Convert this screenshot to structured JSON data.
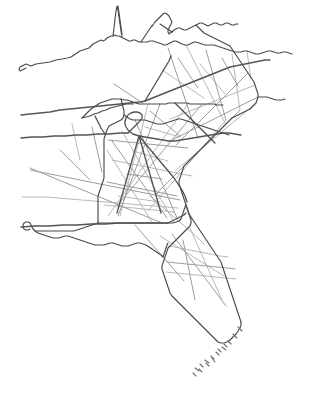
{
  "document": {
    "title": "Southeastern United States Map",
    "description": "Hand-drawn outline map of the southeastern United States showing state boundaries and a network of highways",
    "style": "hand-drawn sketch",
    "background_color": "#ffffff"
  },
  "palette": {
    "background": "#ffffff",
    "state_border": "#4a4a4a",
    "state_border_thin": "#5c5c5c",
    "interstate_major": "#555555",
    "road": "#9d9d9d",
    "road_faint": "#b0b0b0",
    "island": "#6e6e6e"
  },
  "canvas": {
    "width": 310,
    "height": 408
  },
  "map_content": {
    "regions": [
      "Kentucky",
      "West Virginia",
      "Virginia",
      "Tennessee",
      "North Carolina",
      "South Carolina",
      "Georgia",
      "Alabama",
      "Mississippi",
      "Louisiana",
      "Florida",
      "Florida Keys"
    ],
    "feature_types": [
      "state-boundary",
      "interstate-highway",
      "secondary-road",
      "coastline",
      "island-chain"
    ]
  },
  "geometry": {
    "state_borders": [
      "M 22 66 L 26 64 L 31 66 L 36 64 L 43 63 L 50 62 L 56 60 L 62 59 L 67 58 L 71 57 L 74 55 L 77 53 L 80 51 L 83 50 L 86 49 L 89 48 L 91 46 L 93 44 L 95 43 L 97 42 L 99 41 L 101 40 L 103 41 L 105 40 L 107 38 L 109 37 L 111 36 L 113 36 L 115 35 L 117 36 L 119 36 L 121 37 L 123 38 L 125 39 L 127 40 L 129 41 L 131 41 L 133 40 L 135 40 L 137 41 L 139 42 L 141 42 L 144 42 L 147 42 L 150 41 L 153 41 L 156 42 L 159 43 L 162 44 L 164 45 L 166 45 L 168 44 L 170 43 L 172 42 L 174 41 L 176 41 L 178 42 L 180 43 L 182 44 L 185 45 L 188 45 L 190 44 L 192 43 L 194 42 L 196 42 L 199 43 L 202 44 L 205 45 L 208 45 L 211 45 L 214 45 L 217 46 L 220 47 L 223 48 L 226 49 L 229 50 L 232 51 L 235 52 L 238 52 L 241 52 L 244 51 L 247 51 L 250 52 L 253 53 L 256 54 L 259 54 L 262 53 L 265 52 L 268 51 L 271 51 L 274 52 L 277 53 L 280 53 L 283 52 L 286 52 L 289 53 L 292 54",
      "M 113 36 L 114 28 L 115 19 L 116 11 L 117 6 L 118 10 L 119 17 L 120 24 L 121 31 L 122 37",
      "M 141 42 L 143 39 L 145 36 L 147 33 L 149 30 L 151 27 L 153 25 L 155 22 L 157 20 L 159 18 L 161 16 L 163 14 L 165 13 L 167 14 L 169 16 L 170 18 L 171 20 L 172 22 L 171 24 L 170 26 L 169 28 L 168 30 L 168 32 L 169 34 L 170 33 L 172 32 L 174 30 L 176 29 L 178 28 L 180 28 L 182 29 L 184 30 L 186 30 L 188 29 L 190 28 L 192 27 L 194 26 L 196 25 L 198 24 L 200 23 L 202 23 L 204 24 L 206 25 L 208 26 L 210 25 L 212 24 L 214 23 L 216 23 L 218 24 L 220 25 L 222 25 L 224 24 L 226 23 L 228 23 L 230 24 L 232 25 L 234 25 L 236 24 L 238 24",
      "M 160 24 L 163 26 L 166 28 L 169 30 L 172 32",
      "M 196 25 L 198 27 L 200 29 L 202 31 L 204 33 L 206 34 L 208 35 L 210 36 L 212 37 L 214 38 L 216 39 L 218 40 L 220 41 L 222 42 L 224 43 L 226 44 L 228 45 L 230 46",
      "M 118 6 L 119 13 L 120 20 L 121 27 L 122 34",
      "M 22 66 L 20 67 L 19 69 L 20 71 L 22 70 L 24 69 L 26 68",
      "M 82 118 L 85 115 L 88 112 L 91 109 L 94 107 L 97 105 L 100 103 L 103 102 L 106 101 L 109 100 L 112 99 L 115 99 L 118 99 L 121 99 L 124 100 L 127 100 L 130 101 L 133 102 L 136 103 L 139 104 L 142 104 L 145 104 L 148 104 L 151 104 L 154 104 L 157 104 L 160 104 L 163 104 L 166 104 L 169 103 L 172 103 L 175 103 L 178 103 L 181 103 L 184 103 L 187 103 L 190 104 L 193 104 L 196 104 L 199 104 L 202 104 L 205 104 L 208 104 L 211 104 L 214 104 L 217 105 L 220 105 L 223 105",
      "M 82 118 L 86 117 L 90 116 L 94 114 L 98 113 L 102 111 L 106 110 L 110 108 L 114 107 L 118 106 L 122 105 L 126 104 L 130 104 L 133 104",
      "M 230 46 L 232 49 L 234 52 L 236 55 L 238 58 L 240 61 L 242 64 L 244 67 L 246 70 L 248 73 L 250 76 L 252 79 L 254 82 L 255 85 L 256 88 L 257 91 L 258 94 L 258 97 L 257 100 L 256 103 L 254 105 L 252 107 L 250 109 L 248 110 L 246 111 L 244 112 L 242 113 L 240 114 L 238 115 L 236 116 L 234 117 L 232 118",
      "M 258 97 L 261 97 L 264 97 L 267 97 L 270 98 L 273 99 L 276 100 L 279 100 L 282 100 L 285 99",
      "M 232 118 L 230 120 L 228 122 L 226 124 L 224 126 L 222 128 L 220 130 L 218 132 L 216 134 L 214 136 L 212 138 L 210 140 L 208 142 L 206 144 L 204 146 L 202 148 L 200 150 L 198 152 L 196 154 L 194 156 L 192 158 L 190 160 L 188 162 L 186 164 L 184 166 L 183 169 L 182 172 L 181 175 L 180 178 L 179 181 L 179 184 L 180 187 L 181 190 L 182 193 L 183 196 L 184 199 L 185 202 L 186 205 L 187 208 L 188 211 L 189 214",
      "M 121 99 L 122 103 L 123 107 L 124 111 L 124 115 L 123 118 L 121 120 L 119 121 L 117 122 L 115 123 L 113 124 L 111 125 L 109 126 L 108 128 L 107 130 L 106 133 L 105 136 L 104 139 L 104 142 L 104 145 L 104 148 L 104 151 L 104 154 L 104 157 L 104 160 L 104 163 L 104 166 L 104 169 L 104 172 L 104 175 L 104 178 L 103 181 L 102 184 L 101 187 L 100 190 L 99 193 L 98 196 L 98 199 L 98 202 L 98 205 L 98 208 L 98 211 L 98 214 L 98 217 L 98 220 L 98 223",
      "M 124 115 L 127 117 L 130 119 L 133 120 L 136 120 L 139 120 L 142 120 L 145 120 L 148 121 L 151 122 L 154 123 L 157 124 L 160 124 L 163 124 L 166 123 L 169 122 L 172 121 L 175 120 L 178 119 L 181 119 L 184 120 L 187 121 L 190 122 L 193 123 L 196 124 L 199 125 L 202 126 L 205 127 L 208 128 L 211 129 L 214 130 L 217 131 L 220 132 L 223 133 L 226 134 L 229 135",
      "M 98 223 L 101 223 L 104 223 L 107 223 L 110 223 L 113 223 L 116 223 L 119 223 L 122 223 L 125 223 L 128 223 L 131 223 L 134 223 L 137 223 L 140 223 L 143 223 L 146 223 L 149 223 L 152 223 L 155 223 L 158 223 L 161 223 L 164 223 L 167 223 L 170 223 L 173 223 L 176 222 L 179 221 L 181 219 L 182 216 L 183 213 L 184 210 L 185 207 L 186 205",
      "M 189 214 L 191 217 L 193 220 L 195 223 L 197 226 L 199 229 L 201 232 L 203 235 L 205 238 L 207 241 L 209 244 L 211 247 L 213 250 L 215 253 L 217 256 L 219 259 L 221 262 L 222 265 L 223 268 L 224 271 L 225 274 L 226 277 L 227 280 L 228 283 L 229 286 L 230 289 L 231 292 L 232 295 L 233 298 L 234 301 L 235 304 L 236 307 L 237 310 L 238 313 L 239 316 L 240 319 L 241 322",
      "M 186 205 L 187 208 L 188 211 L 189 214 L 190 217 L 191 220 L 191 223 L 190 226 L 188 228 L 186 230 L 184 232 L 182 234 L 180 236 L 178 238 L 176 240 L 174 242 L 172 244 L 170 246 L 168 248 L 167 251 L 166 254 L 165 257 L 164 260 L 163 263 L 162 266 L 162 269 L 163 272 L 164 275 L 165 278 L 166 281 L 167 284 L 168 287 L 169 290 L 170 293 L 172 296 L 174 298 L 176 300 L 178 302 L 180 304 L 182 306 L 184 308 L 186 310 L 188 312 L 190 314 L 192 316 L 194 318 L 196 320 L 198 322 L 200 324 L 202 326 L 204 328 L 206 330 L 208 332 L 210 334 L 212 336 L 214 338 L 216 340 L 218 342 L 221 343 L 224 343 L 227 342 L 230 340 L 233 337 L 236 334 L 238 331 L 240 328 L 241 325 L 241 322",
      "M 98 223 L 95 224 L 92 225 L 89 226 L 86 227 L 83 228 L 80 229 L 77 230 L 74 231 L 71 231 L 68 231 L 65 231 L 62 231 L 59 231 L 56 231 L 53 231 L 50 231 L 47 231 L 44 231 L 41 231 L 38 231 L 35 231 L 33 229 L 32 227 L 31 225 L 30 223 L 28 222 L 26 222 L 24 223 L 23 225 L 23 227 L 24 229 L 26 230 L 28 230 L 30 229",
      "M 35 231 L 38 233 L 41 234 L 44 235 L 47 236 L 50 237 L 53 238 L 56 238 L 59 238 L 62 237 L 65 236 L 68 236 L 71 237 L 74 238 L 77 239 L 80 240 L 83 241 L 86 242 L 89 243 L 92 244 L 95 245 L 98 245 L 101 245 L 104 245 L 107 244 L 110 243 L 113 243 L 116 244 L 119 245 L 122 246 L 125 246 L 128 246 L 131 245 L 134 244 L 137 243 L 140 243 L 143 244 L 146 245 L 149 247 L 152 249 L 155 251 L 158 253 L 161 255 L 163 257",
      "M 163 257 L 164 254 L 165 251 L 166 248 L 167 245 L 168 243"
    ],
    "interstates": [
      "M 21 115 L 30 114 L 40 113 L 50 112 L 60 110 L 70 109 L 80 108 L 90 107 L 100 106 L 110 105 L 120 104 L 130 103 L 140 102 L 145 101",
      "M 145 101 L 150 99 L 155 97 L 160 95 L 165 93 L 170 91 L 175 89 L 180 87 L 185 85 L 190 83 L 195 81 L 200 79 L 205 77 L 210 75 L 215 73 L 220 71 L 225 69 L 230 67 L 235 66 L 240 65 L 245 64 L 250 63 L 255 62 L 260 61 L 265 60 L 270 60",
      "M 21 138 L 32 137 L 43 137 L 54 136 L 65 136 L 76 135 L 87 135 L 98 134 L 109 134 L 120 133 L 128 133",
      "M 128 133 L 131 130 L 134 127 L 137 124 L 140 121 L 142 118 L 142 115 L 140 113 L 137 112 L 134 112 L 131 113 L 128 115 L 126 118 L 125 121 L 125 124 L 126 127 L 128 130 L 130 132 L 133 134 L 136 135 L 139 136",
      "M 139 136 L 145 137 L 151 138 L 157 139 L 163 140 L 169 141 L 175 141 L 181 140 L 187 139 L 193 138 L 199 137 L 205 136 L 211 135 L 217 134 L 223 133 L 229 133 L 235 134 L 241 135",
      "M 139 136 L 144 142 L 149 148 L 154 154 L 159 160 L 164 166 L 169 172 L 174 178 L 178 184 L 182 190 L 185 196 L 187 202",
      "M 139 136 L 141 143 L 143 150 L 145 157 L 147 164 L 149 171 L 151 178 L 153 185 L 155 192 L 157 199 L 159 206 L 161 213",
      "M 139 136 L 137 143 L 135 150 L 133 157 L 131 164 L 129 171 L 127 178 L 125 185 L 123 192 L 121 199 L 119 206 L 117 213",
      "M 95 116 L 97 120 L 99 124 L 101 128 L 103 131 L 105 134",
      "M 175 103 L 180 108 L 185 113 L 190 118 L 195 123 L 200 128 L 205 133 L 210 138 L 215 143",
      "M 21 227 L 35 226 L 49 226 L 63 225 L 77 225 L 91 224 L 105 224 L 119 223 L 133 223 L 147 223 L 161 223 L 168 223",
      "M 168 223 L 172 221 L 176 219 L 180 217 L 184 215 L 186 213",
      "M 145 101 L 148 96 L 151 91 L 154 86 L 157 81 L 160 76 L 163 71 L 166 66 L 169 61 L 171 56"
    ],
    "roads": [
      "M 168 48 L 170 54 L 172 60 L 174 66 L 176 72 L 178 78 L 180 84 L 182 90 L 184 96 L 186 102 L 188 108 L 190 114 L 192 120 L 194 126 L 196 132 L 198 138",
      "M 186 45 L 189 51 L 192 57 L 195 63 L 198 69 L 201 75 L 204 81 L 207 87 L 210 93 L 213 99 L 216 105 L 219 111 L 222 117 L 225 123",
      "M 206 50 L 208 57 L 210 64 L 212 71 L 214 78 L 216 85 L 218 92 L 220 99 L 222 106 L 224 113 L 226 120",
      "M 232 54 L 233 61 L 234 68 L 235 75 L 236 82 L 237 89 L 238 96 L 239 103 L 240 110",
      "M 248 73 L 244 77 L 240 81 L 236 85 L 232 89 L 228 93 L 224 97 L 220 101 L 216 105 L 212 109 L 208 113 L 204 117 L 200 121 L 196 125 L 192 129 L 188 133 L 184 137 L 180 141 L 176 145",
      "M 255 85 L 250 87 L 245 89 L 240 91 L 235 93 L 230 95 L 225 97 L 220 99 L 215 101 L 210 103 L 205 105 L 200 107 L 195 109 L 190 111 L 185 113 L 180 115 L 175 117 L 170 119",
      "M 258 97 L 252 100 L 246 103 L 240 106 L 234 109 L 228 112 L 222 115 L 216 118 L 210 121 L 204 124 L 198 127 L 192 130 L 186 133 L 180 136 L 174 139 L 168 142",
      "M 254 105 L 248 110 L 242 115 L 236 120 L 230 125 L 224 130 L 218 135 L 212 140 L 206 145 L 200 150 L 194 155 L 188 160 L 182 165 L 176 170",
      "M 240 110 L 234 116 L 228 122 L 222 128 L 216 134 L 210 140 L 204 146 L 198 152 L 192 158 L 186 164 L 180 170 L 174 176 L 168 182 L 162 188 L 156 194",
      "M 226 120 L 220 127 L 214 134 L 208 141 L 202 148 L 196 155 L 190 162 L 184 169 L 178 176 L 172 183 L 166 190 L 160 197 L 154 204 L 148 211",
      "M 202 104 L 197 110 L 192 116 L 187 122 L 182 128 L 177 134 L 172 140 L 167 146 L 162 152 L 157 158 L 152 164 L 147 170 L 142 176 L 137 182 L 132 188 L 127 194 L 122 200 L 117 206",
      "M 188 104 L 183 111 L 178 118 L 173 125 L 168 132 L 163 139 L 158 146 L 153 153 L 148 160 L 143 167 L 138 174 L 133 181 L 128 188 L 123 195 L 118 202 L 113 209 L 108 216",
      "M 160 104 L 157 112 L 154 120 L 151 128 L 148 136 L 145 144 L 142 152 L 139 160 L 136 168 L 133 176 L 130 184 L 127 192 L 124 200 L 121 208 L 118 216",
      "M 148 104 L 146 112 L 144 120 L 142 128 L 140 136 L 138 144 L 136 152 L 134 160 L 132 168 L 130 176 L 128 184 L 126 192 L 124 200 L 122 208 L 120 216",
      "M 135 120 L 138 127 L 141 134 L 144 141 L 147 148 L 150 155 L 153 162 L 156 169 L 159 176 L 162 183 L 165 190 L 168 197 L 171 204 L 174 211 L 177 218",
      "M 122 131 L 126 138 L 130 145 L 134 152 L 138 159 L 142 166 L 146 173 L 150 180 L 154 187 L 158 194 L 162 201 L 166 208 L 170 215 L 174 222",
      "M 112 141 L 117 148 L 122 155 L 127 162 L 132 169 L 137 176 L 142 183 L 147 190 L 152 197 L 157 204 L 162 211 L 167 218",
      "M 107 150 L 112 158 L 117 166 L 122 174 L 127 182 L 132 190 L 137 198 L 142 206 L 147 214 L 152 222",
      "M 30 170 L 40 172 L 50 174 L 60 176 L 70 178 L 80 180 L 90 182 L 100 184 L 110 186 L 120 188 L 130 190 L 140 192 L 150 194 L 160 196 L 170 198 L 180 200",
      "M 22 197 L 34 197 L 46 197 L 58 198 L 70 199 L 82 200 L 94 201 L 106 202 L 118 203 L 130 204 L 142 205 L 154 206 L 166 207 L 178 208",
      "M 30 168 L 42 173 L 54 178 L 66 183 L 78 188 L 90 193 L 102 198 L 114 203 L 126 208 L 138 213 L 150 218 L 162 223",
      "M 112 160 L 122 162 L 132 164 L 142 166 L 152 168 L 162 170 L 172 172 L 182 174 L 192 176",
      "M 107 182 L 117 184 L 127 186 L 137 188 L 147 190 L 157 192 L 167 194 L 177 196",
      "M 104 205 L 114 206 L 124 207 L 134 208 L 144 209 L 154 210 L 164 211 L 174 212",
      "M 108 140 L 118 141 L 128 142 L 138 143 L 148 144 L 158 145 L 168 146 L 178 147 L 188 148",
      "M 150 196 L 158 203 L 166 210 L 174 217 L 182 224 L 190 231 L 198 238 L 204 244",
      "M 135 225 L 142 233 L 149 241 L 156 249 L 163 257 L 170 265 L 177 273 L 184 281",
      "M 170 246 L 180 248 L 190 250 L 200 252 L 210 254 L 220 256 L 228 257",
      "M 167 262 L 177 263 L 187 264 L 197 265 L 207 266 L 217 267 L 227 268 L 235 269",
      "M 166 272 L 176 273 L 186 274 L 196 275 L 206 276 L 216 277 L 226 278 L 236 279",
      "M 172 234 L 178 242 L 184 250 L 190 258 L 196 266 L 202 274 L 208 282 L 214 290 L 220 298 L 226 306",
      "M 190 228 L 194 237 L 198 246 L 202 255 L 206 264 L 210 273 L 214 282 L 218 291 L 222 300",
      "M 183 240 L 185 250 L 187 260 L 189 270 L 191 280 L 193 290 L 195 300",
      "M 160 236 L 168 241 L 176 246 L 184 251 L 192 256 L 200 261 L 208 266 L 216 271 L 224 276",
      "M 114 84 L 120 88 L 126 92 L 132 96 L 138 100 L 143 103",
      "M 200 64 L 205 70 L 210 76 L 215 82 L 220 88 L 225 94",
      "M 222 58 L 226 65 L 230 72 L 234 79 L 238 86",
      "M 247 51 L 248 58 L 249 65 L 250 72 L 251 79",
      "M 178 58 L 182 64 L 186 70 L 190 76 L 194 82 L 198 88",
      "M 162 70 L 168 74 L 174 78 L 180 82 L 186 86 L 192 90 L 198 94 L 204 98",
      "M 150 111 L 156 116 L 162 121 L 168 126 L 174 131 L 180 136",
      "M 145 127 L 152 129 L 159 131 L 166 133 L 173 135 L 180 137",
      "M 60 150 L 66 156 L 72 162 L 78 168 L 84 174 L 90 180",
      "M 72 124 L 74 133 L 76 142 L 78 151 L 80 160",
      "M 92 127 L 94 136 L 96 145 L 98 154 L 100 163 L 102 172",
      "M 133 151 L 140 153 L 147 155 L 154 157 L 161 159 L 168 161",
      "M 127 174 L 134 175 L 141 176 L 148 177 L 155 178 L 162 179",
      "M 118 196 L 125 197 L 132 198 L 139 199 L 146 200 L 153 201 L 160 202"
    ],
    "keys_islands": [
      "M 238 327 L 242 331",
      "M 233 334 L 237 338",
      "M 228 341 L 231 344",
      "M 222 347 L 226 350",
      "M 216 352 L 219 355",
      "M 211 356 L 214 359",
      "M 205 360 L 209 363",
      "M 200 364 L 203 367",
      "M 195 368 L 199 371",
      "M 212 358 L 215 362",
      "M 206 363 L 209 366",
      "M 199 369 L 202 372",
      "M 193 373 L 196 376",
      "M 224 344 L 227 347",
      "M 218 349 L 221 352"
    ]
  }
}
